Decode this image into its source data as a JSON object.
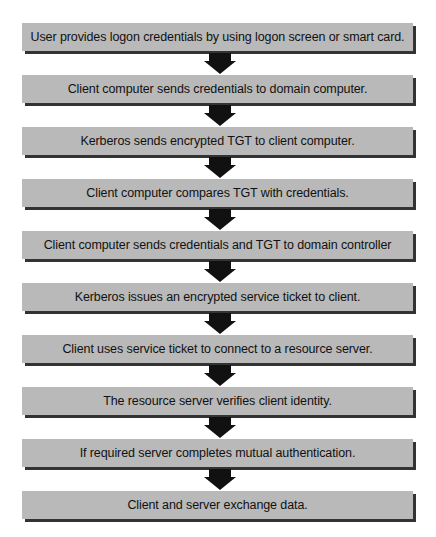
{
  "diagram": {
    "type": "flowchart",
    "direction": "top-to-bottom",
    "colors": {
      "box_fill": "#b9b9b9",
      "box_shadow": "#333333",
      "text": "#111111",
      "arrow": "#111111",
      "background": "#ffffff"
    },
    "steps": [
      {
        "label": "User provides logon credentials by using logon screen or smart card."
      },
      {
        "label": "Client computer sends credentials to domain computer."
      },
      {
        "label": "Kerberos sends encrypted TGT to client computer."
      },
      {
        "label": "Client computer compares TGT with credentials."
      },
      {
        "label": "Client computer sends credentials and TGT to domain controller"
      },
      {
        "label": "Kerberos issues an encrypted service ticket to client."
      },
      {
        "label": "Client uses service ticket to connect to a resource server."
      },
      {
        "label": "The resource server verifies client identity."
      },
      {
        "label": "If required server completes mutual authentication."
      },
      {
        "label": "Client and server exchange data."
      }
    ],
    "connectors": [
      {
        "from": 0,
        "to": 1,
        "icon": "down-arrow-icon"
      },
      {
        "from": 1,
        "to": 2,
        "icon": "down-arrow-icon"
      },
      {
        "from": 2,
        "to": 3,
        "icon": "down-arrow-icon"
      },
      {
        "from": 3,
        "to": 4,
        "icon": "down-arrow-icon"
      },
      {
        "from": 4,
        "to": 5,
        "icon": "down-arrow-icon"
      },
      {
        "from": 5,
        "to": 6,
        "icon": "down-arrow-icon"
      },
      {
        "from": 6,
        "to": 7,
        "icon": "down-arrow-icon"
      },
      {
        "from": 7,
        "to": 8,
        "icon": "down-arrow-icon"
      },
      {
        "from": 8,
        "to": 9,
        "icon": "down-arrow-icon"
      }
    ]
  }
}
